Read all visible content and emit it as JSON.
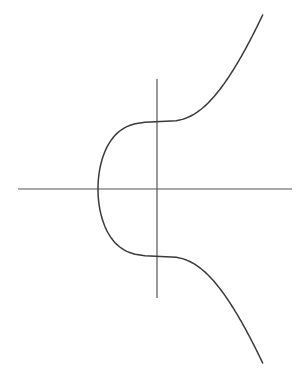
{
  "figure": {
    "background": "#ffffff",
    "axis_color": "#555555",
    "curve_color": "#3a3a3a"
  },
  "chart_data": {
    "type": "line",
    "title": "",
    "xlabel": "",
    "ylabel": "",
    "equation": "y^2 = x^3 + 2.145",
    "params": {
      "a": 0,
      "b": 2.145
    },
    "x_range": [
      -1.29,
      2.31
    ],
    "y_range": [
      -3.82,
      3.82
    ],
    "grid": false,
    "legend": null,
    "key_points": [
      {
        "label": "x-intercept",
        "x": -1.29,
        "y": 0
      },
      {
        "label": "upper y-intercept",
        "x": 0,
        "y": 1.465
      },
      {
        "label": "lower y-intercept",
        "x": 0,
        "y": -1.465
      }
    ]
  },
  "layout": {
    "origin_px": [
      157,
      189
    ],
    "scale_px_per_unit": 45.75,
    "x_axis_px": [
      18,
      292
    ],
    "y_axis_px": [
      79,
      298
    ]
  }
}
